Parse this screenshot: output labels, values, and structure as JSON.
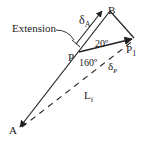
{
  "diagram": {
    "labels": {
      "A": "A",
      "B": "B",
      "P": "P",
      "P1_main": "P",
      "P1_sub": "1",
      "extension": "Extension",
      "deltaA_main": "δ",
      "deltaA_sub": "A",
      "deltaP_main": "δ",
      "deltaP_sub": "P",
      "Lf_main": "L",
      "Lf_sub": "f",
      "angle20": "20º",
      "angle160": "160º"
    },
    "colors": {
      "stroke": "#222222",
      "text": "#222222",
      "background": "#ffffff"
    }
  }
}
